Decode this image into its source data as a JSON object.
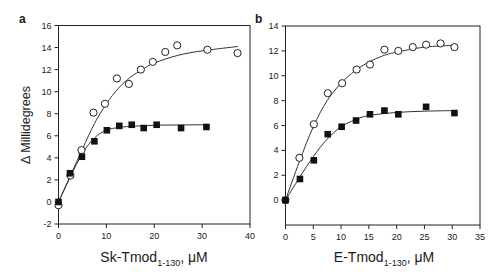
{
  "figure": {
    "ylabel": "Δ Millidegrees"
  },
  "chart_data": [
    {
      "type": "scatter",
      "panel_label": "a",
      "title": "",
      "xlabel_main": "Sk-Tmod",
      "xlabel_sub": "1-130",
      "xlabel_unit": ", μM",
      "ylabel": "Δ Millidegrees",
      "xlim": [
        0,
        40
      ],
      "ylim": [
        -2,
        16
      ],
      "xticks": [
        0,
        10,
        20,
        30,
        40
      ],
      "yticks": [
        -2,
        0,
        2,
        4,
        6,
        8,
        10,
        12,
        14,
        16
      ],
      "grid": false,
      "legend": null,
      "series": [
        {
          "name": "open circles",
          "marker": "circle-open",
          "x": [
            0,
            2.5,
            4.8,
            7.3,
            9.7,
            12.2,
            14.7,
            17.2,
            19.7,
            22.3,
            24.8,
            31.1,
            37.4
          ],
          "y": [
            -0.3,
            2.4,
            4.7,
            8.1,
            8.9,
            11.2,
            10.7,
            12.0,
            12.7,
            13.6,
            14.2,
            13.8,
            13.5
          ],
          "fit_x": [
            0,
            2.5,
            5,
            7.5,
            10,
            12.5,
            15,
            17.5,
            20,
            25,
            30,
            37.5
          ],
          "fit_y": [
            0,
            2.4,
            4.8,
            7.1,
            8.9,
            10.3,
            11.3,
            12.0,
            12.6,
            13.3,
            13.7,
            14.1
          ]
        },
        {
          "name": "filled squares",
          "marker": "square-filled",
          "x": [
            0,
            2.4,
            4.9,
            7.5,
            10.1,
            12.7,
            15.3,
            17.8,
            20.5,
            25.6,
            30.9
          ],
          "y": [
            0,
            2.6,
            4.1,
            5.5,
            6.5,
            6.9,
            7.0,
            6.7,
            7.0,
            6.7,
            6.8
          ],
          "fit_x": [
            0,
            2.5,
            5,
            7.5,
            10,
            12.5,
            15,
            20,
            25,
            31
          ],
          "fit_y": [
            0,
            2.3,
            4.4,
            5.8,
            6.5,
            6.75,
            6.85,
            6.95,
            6.98,
            7.0
          ]
        }
      ]
    },
    {
      "type": "scatter",
      "panel_label": "b",
      "title": "",
      "xlabel_main": "E-Tmod",
      "xlabel_sub": "1-130",
      "xlabel_unit": ", μM",
      "ylabel": "",
      "xlim": [
        0,
        35
      ],
      "ylim": [
        -2,
        14
      ],
      "xticks": [
        0,
        5,
        10,
        15,
        20,
        25,
        30,
        35
      ],
      "yticks": [
        0,
        2,
        4,
        6,
        8,
        10,
        12,
        14
      ],
      "grid": false,
      "legend": null,
      "series": [
        {
          "name": "open circles",
          "marker": "circle-open",
          "x": [
            0,
            2.5,
            5.1,
            7.6,
            10.2,
            12.8,
            15.2,
            17.8,
            20.3,
            22.9,
            25.3,
            27.9,
            30.4
          ],
          "y": [
            0,
            3.4,
            6.1,
            8.6,
            9.4,
            10.5,
            10.9,
            12.1,
            12.0,
            12.3,
            12.5,
            12.6,
            12.3
          ],
          "fit_x": [
            0,
            2.5,
            5,
            7.5,
            10,
            12.5,
            15,
            17.5,
            20,
            25,
            30.5
          ],
          "fit_y": [
            0,
            3.1,
            5.9,
            8.0,
            9.4,
            10.4,
            11.1,
            11.6,
            11.9,
            12.3,
            12.45
          ]
        },
        {
          "name": "filled squares",
          "marker": "square-filled",
          "x": [
            0,
            2.6,
            5.1,
            7.6,
            10.1,
            12.7,
            15.2,
            17.8,
            20.3,
            25.3,
            30.4
          ],
          "y": [
            0,
            1.7,
            3.2,
            5.3,
            5.9,
            6.4,
            6.9,
            7.2,
            6.9,
            7.5,
            7.0
          ],
          "fit_x": [
            0,
            2.5,
            5,
            7.5,
            10,
            12.5,
            15,
            20,
            25,
            30.5
          ],
          "fit_y": [
            0,
            1.8,
            3.5,
            4.9,
            5.9,
            6.45,
            6.8,
            7.05,
            7.15,
            7.2
          ]
        }
      ]
    }
  ]
}
